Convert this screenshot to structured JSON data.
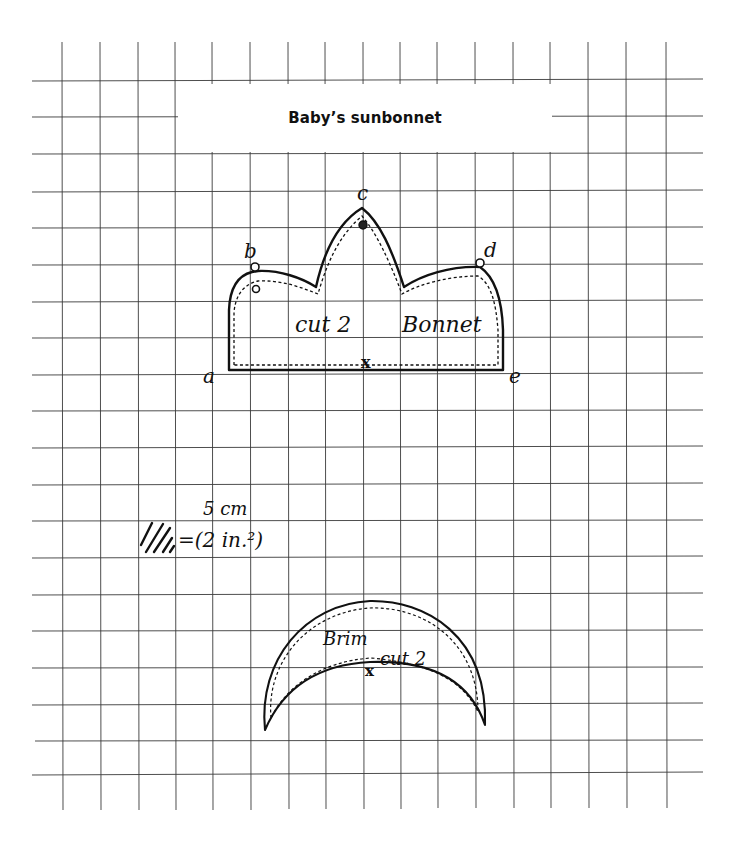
{
  "title": "Baby’s sunbonnet",
  "grid": {
    "cell_size_px": 37.6,
    "line_color": "#3a3a3a",
    "scale_label_top": "5 cm",
    "scale_label_bottom": "=(2 in.²)"
  },
  "bonnet": {
    "label_cut": "cut 2",
    "label_name": "Bonnet",
    "points": {
      "a": "a",
      "b": "b",
      "c": "c",
      "d": "d",
      "e": "e"
    },
    "center_mark": "x"
  },
  "brim": {
    "label_name": "Brim",
    "label_cut": "cut 2",
    "center_mark": "x"
  }
}
